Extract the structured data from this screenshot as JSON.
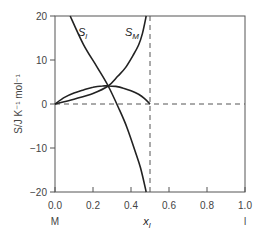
{
  "chart_data": {
    "type": "line",
    "title": "",
    "xlabel": "x_l",
    "ylabel": "S / J K⁻¹ mol⁻¹",
    "xlim": [
      0.0,
      1.0
    ],
    "ylim": [
      -20,
      20
    ],
    "x_ticks": [
      "0.0",
      "0.2",
      "0.4",
      "0.6",
      "0.8",
      "1.0"
    ],
    "y_ticks": [
      "20",
      "10",
      "0",
      "−10",
      "−20"
    ],
    "x_end_labels": {
      "left": "M",
      "right": "l"
    },
    "grid": false,
    "reference_lines": [
      {
        "type": "horizontal",
        "y": 0,
        "style": "dashed"
      },
      {
        "type": "vertical",
        "x": 0.5,
        "style": "dashed"
      }
    ],
    "series": [
      {
        "name": "S_l",
        "x": [
          0.08,
          0.15,
          0.22,
          0.28,
          0.34,
          0.38,
          0.42,
          0.45,
          0.48
        ],
        "y": [
          20,
          13.5,
          8.5,
          4.1,
          -1.4,
          -5.5,
          -10.5,
          -14.5,
          -20
        ]
      },
      {
        "name": "S_M",
        "x": [
          0.0,
          0.1,
          0.2,
          0.28,
          0.33,
          0.37,
          0.41,
          0.44,
          0.46,
          0.48
        ],
        "y": [
          0,
          1.1,
          2.4,
          4.1,
          6.3,
          8.2,
          11,
          13.4,
          16,
          20
        ]
      },
      {
        "name": "S_mix",
        "x": [
          0.0,
          0.05,
          0.1,
          0.15,
          0.2,
          0.25,
          0.28,
          0.32,
          0.36,
          0.4,
          0.44,
          0.47,
          0.5
        ],
        "y": [
          0,
          1.5,
          2.5,
          3.2,
          3.8,
          4.1,
          4.1,
          4.0,
          3.6,
          3.0,
          2.2,
          1.3,
          0
        ]
      }
    ],
    "annotations": [
      {
        "text": "S_l",
        "x": 0.13,
        "y": 15.5
      },
      {
        "text": "S_M",
        "x": 0.4,
        "y": 15.5
      }
    ]
  },
  "labels": {
    "y20": "20",
    "y10": "10",
    "y0": "0",
    "yn10": "−10",
    "yn20": "−20",
    "x0": "0.0",
    "x2": "0.2",
    "x4": "0.4",
    "x6": "0.6",
    "x8": "0.8",
    "x10": "1.0",
    "left_end": "M",
    "right_end": "l",
    "xlabel_main": "x",
    "xlabel_sub": "l",
    "ylabel": "S/J K⁻¹ mol⁻¹",
    "sl_main": "S",
    "sl_sub": "l",
    "sm_main": "S",
    "sm_sub": "M"
  }
}
